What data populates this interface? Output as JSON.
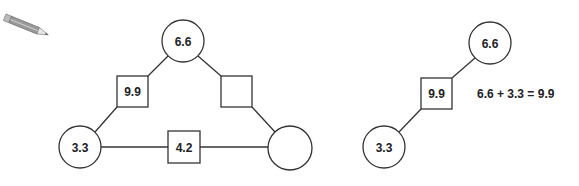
{
  "pencil_icon": "pencil-icon",
  "left_diagram": {
    "circles": [
      {
        "id": "top",
        "label": "6.6",
        "cx": 183,
        "cy": 41,
        "r": 21
      },
      {
        "id": "bottom-left",
        "label": "3.3",
        "cx": 80,
        "cy": 147,
        "r": 21
      },
      {
        "id": "bottom-right",
        "label": "",
        "cx": 290,
        "cy": 148,
        "r": 22
      }
    ],
    "squares": [
      {
        "id": "left-edge",
        "label": "9.9",
        "x": 117,
        "y": 76,
        "size": 31
      },
      {
        "id": "right-edge",
        "label": "",
        "x": 221,
        "y": 76,
        "size": 31
      },
      {
        "id": "bottom-edge",
        "label": "4.2",
        "x": 168,
        "y": 131,
        "size": 32
      }
    ]
  },
  "right_diagram": {
    "circles": [
      {
        "id": "top",
        "label": "6.6",
        "cx": 490,
        "cy": 43,
        "r": 21
      },
      {
        "id": "bottom",
        "label": "3.3",
        "cx": 384,
        "cy": 147,
        "r": 21
      }
    ],
    "squares": [
      {
        "id": "edge",
        "label": "9.9",
        "x": 421,
        "y": 78,
        "size": 31
      }
    ],
    "equation": "6.6 + 3.3 = 9.9"
  }
}
